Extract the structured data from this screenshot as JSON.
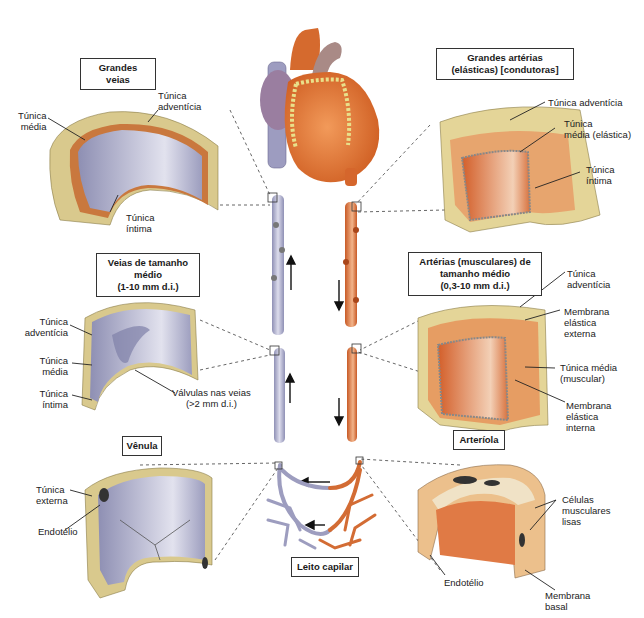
{
  "title_boxes": {
    "grandes_veias": "Grandes veias",
    "grandes_arterias_l1": "Grandes artérias",
    "grandes_arterias_l2": "(elásticas)  [condutoras]",
    "veias_medio_l1": "Veias de tamanho",
    "veias_medio_l2": "médio",
    "veias_medio_l3": "(1-10 mm d.i.)",
    "arterias_medio_l1": "Artérias (musculares) de",
    "arterias_medio_l2": "tamanho médio",
    "arterias_medio_l3": "(0,3-10 mm d.i.)",
    "venula": "Vênula",
    "arteriola": "Arteríola",
    "leito_capilar": "Leito capilar"
  },
  "labels": {
    "gv_media_l1": "Túnica",
    "gv_media_l2": "média",
    "gv_adventicia_l1": "Túnica",
    "gv_adventicia_l2": "adventícia",
    "gv_intima_l1": "Túnica",
    "gv_intima_l2": "íntima",
    "ga_adventicia": "Túnica adventícia",
    "ga_media_l1": "Túnica",
    "ga_media_l2": "média (elástica)",
    "ga_intima_l1": "Túnica",
    "ga_intima_l2": "íntima",
    "vm_adventicia_l1": "Túnica",
    "vm_adventicia_l2": "adventícia",
    "vm_media_l1": "Túnica",
    "vm_media_l2": "média",
    "vm_intima_l1": "Túnica",
    "vm_intima_l2": "íntima",
    "vm_valvulas_l1": "Válvulas nas veias",
    "vm_valvulas_l2": "(>2 mm d.i.)",
    "am_adventicia_l1": "Túnica",
    "am_adventicia_l2": "adventícia",
    "am_mee_l1": "Membrana",
    "am_mee_l2": "elástica",
    "am_mee_l3": "externa",
    "am_media_l1": "Túnica média",
    "am_media_l2": "(muscular)",
    "am_mei_l1": "Membrana",
    "am_mei_l2": "elástica",
    "am_mei_l3": "interna",
    "vn_externa_l1": "Túnica",
    "vn_externa_l2": "externa",
    "vn_endotelio": "Endotélio",
    "ar_celulas_l1": "Células",
    "ar_celulas_l2": "musculares",
    "ar_celulas_l3": "lisas",
    "ar_endotelio": "Endotélio",
    "ar_basal_l1": "Membrana",
    "ar_basal_l2": "basal"
  },
  "colors": {
    "vein": "#a9a9c9",
    "artery": "#d9713a",
    "adventitia": "#d8c98a",
    "media_vein": "#c97a3e",
    "lumen_vein": "#b7b8d2",
    "lumen_artery": "#df7f4c",
    "heart": "#e07b3a",
    "fat": "#e9e08a"
  }
}
